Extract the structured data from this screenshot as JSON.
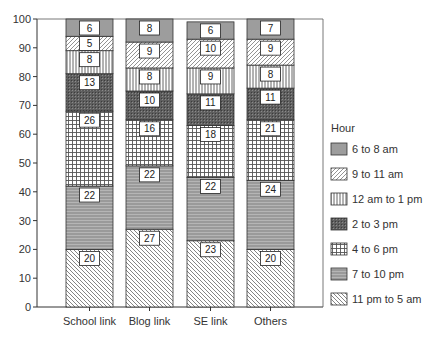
{
  "chart_data": {
    "type": "bar",
    "stacked": true,
    "title": "",
    "xlabel": "",
    "ylabel": "",
    "ylim": [
      0,
      100
    ],
    "yticks": [
      0,
      10,
      20,
      30,
      40,
      50,
      60,
      70,
      80,
      90,
      100
    ],
    "grid": false,
    "categories": [
      "School link",
      "Blog link",
      "SE link",
      "Others"
    ],
    "legend": {
      "title": "Hour",
      "position": "right"
    },
    "series": [
      {
        "name": "11 pm to 5 am",
        "pattern": "diag-back",
        "values": [
          20,
          27,
          23,
          20
        ]
      },
      {
        "name": "7 to 10 pm",
        "pattern": "horizontal-gray",
        "values": [
          22,
          22,
          22,
          24
        ]
      },
      {
        "name": "4 to 6 pm",
        "pattern": "grid",
        "values": [
          26,
          16,
          18,
          21
        ]
      },
      {
        "name": "2 to 3 pm",
        "pattern": "dark-crosshatch",
        "values": [
          13,
          10,
          11,
          11
        ]
      },
      {
        "name": "12 am to 1 pm",
        "pattern": "vertical",
        "values": [
          8,
          8,
          9,
          8
        ]
      },
      {
        "name": "9 to 11 am",
        "pattern": "diag-forward",
        "values": [
          5,
          9,
          10,
          9
        ]
      },
      {
        "name": "6 to 8 am",
        "pattern": "solid-gray",
        "values": [
          6,
          8,
          6,
          7
        ]
      }
    ],
    "legend_order": [
      "6 to 8 am",
      "9 to 11 am",
      "12 am to 1 pm",
      "2 to 3 pm",
      "4 to 6 pm",
      "7 to 10 pm",
      "11 pm to 5 am"
    ]
  },
  "colors": {
    "axis": "#333333",
    "solid_gray": "#9a9a9a",
    "dark_crosshatch": "#5a5a5a"
  }
}
